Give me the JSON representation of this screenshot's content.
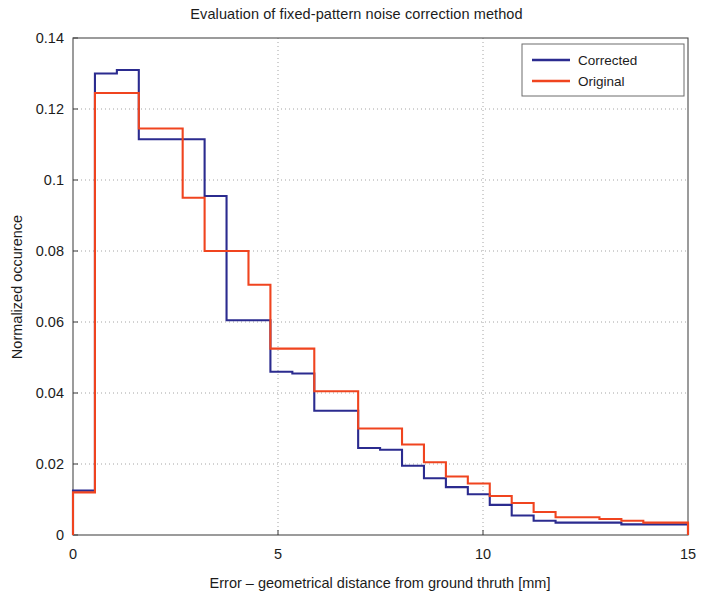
{
  "chart_data": {
    "type": "line",
    "title": "Evaluation of fixed-pattern noise correction method",
    "xlabel": "Error – geometrical distance from ground thruth [mm]",
    "ylabel": "Normalized occurence",
    "xlim": [
      0,
      15
    ],
    "ylim": [
      0,
      0.14
    ],
    "xticks": [
      0,
      5,
      10,
      15
    ],
    "xtick_labels": [
      "0",
      "5",
      "10",
      "15"
    ],
    "yticks": [
      0,
      0.02,
      0.04,
      0.06,
      0.08,
      0.1,
      0.12,
      0.14
    ],
    "ytick_labels": [
      "0",
      "0.02",
      "0.04",
      "0.06",
      "0.08",
      "0.1",
      "0.12",
      "0.14"
    ],
    "grid": true,
    "grid_style": "dotted",
    "legend_position": "top-right",
    "style": "stairs-histogram",
    "bin_width": 0.535,
    "bin_edges": [
      0.0,
      0.535,
      1.07,
      1.605,
      2.14,
      2.675,
      3.21,
      3.745,
      4.28,
      4.815,
      5.35,
      5.885,
      6.42,
      6.955,
      7.49,
      8.025,
      8.56,
      9.095,
      9.63,
      10.165,
      10.7,
      11.235,
      11.77,
      12.305,
      12.84,
      13.375,
      13.91,
      14.445,
      15.0
    ],
    "series": [
      {
        "name": "Corrected",
        "color": "#2b2b8f",
        "values": [
          0.0125,
          0.13,
          0.131,
          0.1115,
          0.1115,
          0.1115,
          0.0955,
          0.0605,
          0.0605,
          0.046,
          0.0455,
          0.035,
          0.035,
          0.0245,
          0.024,
          0.0195,
          0.016,
          0.0135,
          0.0115,
          0.0085,
          0.0055,
          0.004,
          0.0035,
          0.0035,
          0.0035,
          0.003,
          0.003,
          0.003
        ]
      },
      {
        "name": "Original",
        "color": "#f0441f",
        "values": [
          0.012,
          0.1245,
          0.1245,
          0.1145,
          0.1145,
          0.095,
          0.08,
          0.08,
          0.0705,
          0.0525,
          0.0525,
          0.0405,
          0.0405,
          0.03,
          0.03,
          0.0255,
          0.0205,
          0.0165,
          0.0145,
          0.011,
          0.009,
          0.0065,
          0.005,
          0.005,
          0.0045,
          0.004,
          0.0035,
          0.0035
        ]
      }
    ],
    "legend": [
      {
        "label": "Corrected",
        "color": "#2b2b8f"
      },
      {
        "label": "Original",
        "color": "#f0441f"
      }
    ]
  }
}
